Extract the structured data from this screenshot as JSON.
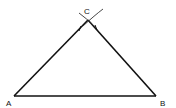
{
  "diagram": {
    "type": "triangle-construction",
    "stroke_color": "#111111",
    "background": "#ffffff",
    "vertices": [
      {
        "label": "A",
        "x": 14,
        "y": 96
      },
      {
        "label": "B",
        "x": 156,
        "y": 96
      },
      {
        "label": "C",
        "x": 88,
        "y": 20
      }
    ],
    "labels": {
      "a": "A",
      "b": "B",
      "c": "C"
    }
  }
}
